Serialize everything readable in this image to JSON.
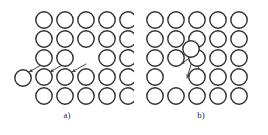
{
  "figure": {
    "background_color": "#ffffff",
    "atom_stroke_color": "#2f2f2f",
    "atom_fill_color": "#ffffff",
    "arrow_color": "#4a4a4a",
    "width": 268,
    "height": 135
  },
  "panels": [
    {
      "id": "a",
      "caption": "a)",
      "defect_type": "vacancy",
      "lattice": {
        "rows": 5,
        "cols": 5,
        "x_start": 44,
        "y_start": 20,
        "x_step": 21,
        "y_step": 19,
        "radius": 8.2,
        "stroke_width": 1.4
      },
      "vacancy_cells": [
        {
          "row": 2,
          "col": 2
        }
      ],
      "extra_atoms": [
        {
          "cx": 23,
          "cy": 78
        }
      ],
      "arrows": [
        {
          "x1": 43,
          "y1": 64,
          "x2": 29,
          "y2": 72
        },
        {
          "x1": 64,
          "y1": 64,
          "x2": 50,
          "y2": 72
        },
        {
          "x1": 86,
          "y1": 64,
          "x2": 72,
          "y2": 72
        }
      ]
    },
    {
      "id": "b",
      "caption": "b)",
      "defect_type": "interstitial",
      "lattice": {
        "rows": 5,
        "cols": 5,
        "x_start": 21,
        "y_start": 20,
        "x_step": 21,
        "y_step": 19,
        "radius": 8.2,
        "stroke_width": 1.4
      },
      "vacancy_cells": [
        {
          "row": 3,
          "col": 1
        }
      ],
      "extra_atoms": [
        {
          "cx": 57,
          "cy": 49
        }
      ],
      "arrows": [
        {
          "x1": 57,
          "y1": 57,
          "x2": 47,
          "y2": 64
        },
        {
          "x1": 59,
          "y1": 58,
          "x2": 53,
          "y2": 78
        },
        {
          "x1": 62,
          "y1": 58,
          "x2": 68,
          "y2": 80
        }
      ]
    }
  ],
  "chart_data": {
    "type": "diagram",
    "panel_labels": [
      "a)",
      "b)"
    ],
    "lattice_rows": 5,
    "lattice_cols": 5,
    "panel_a_vacancy_count": 1,
    "panel_a_displaced_atom_count": 1,
    "panel_a_arrow_count": 3,
    "panel_b_interstitial_count": 1,
    "panel_b_vacancy_count": 1,
    "panel_b_arrow_count": 3
  }
}
